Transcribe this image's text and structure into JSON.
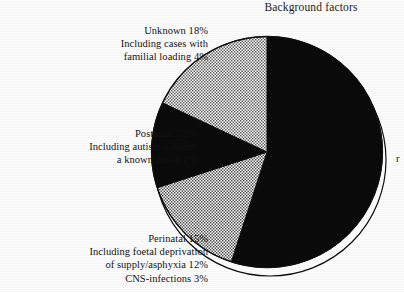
{
  "figure": {
    "title": "Background factors",
    "background_color": "#ffffff",
    "ink_color": "#0b0b0b"
  },
  "chart_data": {
    "type": "pie",
    "title": "Background factors",
    "xlabel": "",
    "ylabel": "",
    "legend_position": "none",
    "grid": false,
    "start_angle_deg": 0,
    "direction": "clockwise",
    "units": "%",
    "categories": [
      "Prenatal",
      "Perinatal",
      "Postnatal",
      "Unknown"
    ],
    "values": [
      55,
      15,
      12,
      18
    ],
    "slices": [
      {
        "name": "Prenatal",
        "value": 55,
        "label": "",
        "fill": "solid-black",
        "color": "#0a0a0a",
        "start_deg": 0,
        "end_deg": 198,
        "label_truncated": true,
        "truncated_text": "r"
      },
      {
        "name": "Perinatal",
        "value": 15,
        "label": "Perinatal 15%",
        "sublabels": [
          "Including foetal deprivation",
          "of supply/asphyxia 12%",
          "CNS-infections 3%"
        ],
        "fill": "hatched-gray",
        "color": "#b9b9b9",
        "start_deg": 198,
        "end_deg": 252
      },
      {
        "name": "Postnatal",
        "value": 12,
        "label": "Postnatal 12%",
        "sublabels": [
          "Including autism without",
          "a known cause 1%"
        ],
        "fill": "solid-black",
        "color": "#0a0a0a",
        "start_deg": 252,
        "end_deg": 295.2
      },
      {
        "name": "Unknown",
        "value": 18,
        "label": "Unknown 18%",
        "sublabels": [
          "Including cases with",
          "familial loading 4%"
        ],
        "fill": "hatched-gray",
        "color": "#b9b9b9",
        "start_deg": 295.2,
        "end_deg": 360
      }
    ]
  },
  "callouts": {
    "unknown": {
      "lines": [
        "Unknown 18%",
        "Including cases with",
        "familial loading 4%"
      ]
    },
    "postnatal": {
      "lines": [
        "Postnatal 12%",
        "Including autism without",
        "a known cause 1%"
      ]
    },
    "perinatal": {
      "lines": [
        "Perinatal 15%",
        "Including foetal deprivation",
        "of supply/asphyxia 12%",
        "CNS-infections 3%"
      ]
    },
    "prenatal_truncated": {
      "text": "r"
    }
  }
}
